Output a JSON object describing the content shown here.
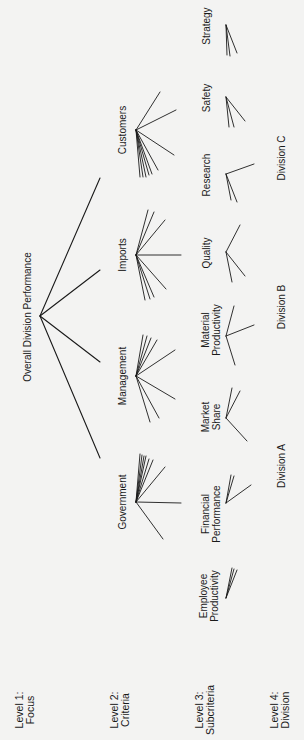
{
  "diagram": {
    "type": "hierarchy",
    "orientation": "rotated-90-ccw",
    "colors": {
      "background": "#f3f3f2",
      "ink": "#1a1a1a"
    },
    "level_labels": [
      {
        "line1": "Level 1:",
        "line2": "Focus",
        "x": 25,
        "y": 710
      },
      {
        "line1": "Level 2:",
        "line2": "Criteria",
        "x": 120,
        "y": 710
      },
      {
        "line1": "Level 3:",
        "line2": "Subcriteria",
        "x": 205,
        "y": 710
      },
      {
        "line1": "Level 4:",
        "line2": "Division",
        "x": 280,
        "y": 710
      }
    ],
    "focus": {
      "label": "Overall Division Performance",
      "label_x": 27,
      "label_y": 317,
      "hub": [
        40,
        316
      ]
    },
    "criteria": [
      {
        "label": "Customers",
        "label_x": 122,
        "label_y": 130,
        "hub": [
          136,
          130
        ],
        "focus_end": [
          100,
          178
        ]
      },
      {
        "label": "Imports",
        "label_x": 122,
        "label_y": 255,
        "hub": [
          136,
          255
        ],
        "focus_end": [
          100,
          270
        ]
      },
      {
        "label": "Management",
        "label_x": 122,
        "label_y": 376,
        "hub": [
          136,
          376
        ],
        "focus_end": [
          100,
          362
        ]
      },
      {
        "label": "Government",
        "label_x": 122,
        "label_y": 502,
        "hub": [
          136,
          502
        ],
        "focus_end": [
          100,
          458
        ]
      }
    ],
    "criteria_fan_ends": {
      "Customers": [
        [
          160,
          92
        ],
        [
          176,
          110
        ],
        [
          174,
          155
        ],
        [
          158,
          170
        ],
        [
          152,
          174
        ],
        [
          149,
          175
        ],
        [
          146,
          177
        ],
        [
          143,
          177
        ],
        [
          140,
          177
        ]
      ],
      "Imports": [
        [
          148,
          210
        ],
        [
          154,
          212
        ],
        [
          165,
          220
        ],
        [
          181,
          255
        ],
        [
          166,
          289
        ],
        [
          154,
          297
        ],
        [
          150,
          299
        ],
        [
          145,
          300
        ]
      ],
      "Management": [
        [
          143,
          335
        ],
        [
          147,
          336
        ],
        [
          151,
          338
        ],
        [
          157,
          340
        ],
        [
          175,
          350
        ],
        [
          175,
          399
        ],
        [
          159,
          418
        ],
        [
          150,
          422
        ]
      ],
      "Government": [
        [
          140,
          454
        ],
        [
          142,
          455
        ],
        [
          144,
          456
        ],
        [
          146,
          456
        ],
        [
          149,
          459
        ],
        [
          153,
          460
        ],
        [
          165,
          467
        ],
        [
          181,
          503
        ],
        [
          163,
          539
        ]
      ]
    },
    "subcriteria": [
      {
        "lines": [
          "Strategy"
        ],
        "label_x": 206,
        "label_y": 26,
        "hub": [
          226,
          25
        ],
        "ends": [
          [
            227,
            55
          ],
          [
            230,
            56
          ],
          [
            237,
            53
          ]
        ]
      },
      {
        "lines": [
          "Safety"
        ],
        "label_x": 206,
        "label_y": 98,
        "hub": [
          226,
          97
        ],
        "ends": [
          [
            229,
            127
          ],
          [
            234,
            127
          ],
          [
            245,
            121
          ]
        ]
      },
      {
        "lines": [
          "Research"
        ],
        "label_x": 206,
        "label_y": 175,
        "hub": [
          226,
          174
        ],
        "ends": [
          [
            254,
            164
          ],
          [
            231,
            200
          ],
          [
            237,
            202
          ]
        ]
      },
      {
        "lines": [
          "Quality"
        ],
        "label_x": 206,
        "label_y": 253,
        "hub": [
          226,
          252
        ],
        "ends": [
          [
            240,
            225
          ],
          [
            232,
            282
          ],
          [
            245,
            276
          ]
        ]
      },
      {
        "lines": [
          "Material",
          "Productivity"
        ],
        "label_x": 211,
        "label_y": 330,
        "hub": [
          226,
          336
        ],
        "ends": [
          [
            234,
            306
          ],
          [
            254,
            325
          ],
          [
            235,
            365
          ]
        ]
      },
      {
        "lines": [
          "Market",
          "Share"
        ],
        "label_x": 211,
        "label_y": 417,
        "hub": [
          226,
          418
        ],
        "ends": [
          [
            232,
            388
          ],
          [
            240,
            391
          ],
          [
            247,
            441
          ]
        ]
      },
      {
        "lines": [
          "Financial",
          "Performance"
        ],
        "label_x": 211,
        "label_y": 514,
        "hub": [
          226,
          503
        ],
        "ends": [
          [
            231,
            475
          ],
          [
            234,
            476
          ],
          [
            251,
            485
          ]
        ]
      },
      {
        "lines": [
          "Employee",
          "Productivity"
        ],
        "label_x": 209,
        "label_y": 596,
        "hub": [
          226,
          598
        ],
        "ends": [
          [
            232,
            568
          ],
          [
            234,
            569
          ],
          [
            237,
            570
          ]
        ]
      }
    ],
    "divisions": [
      {
        "label": "Division A",
        "x": 281,
        "y": 466
      },
      {
        "label": "Division B",
        "x": 281,
        "y": 307
      },
      {
        "label": "Division C",
        "x": 281,
        "y": 158
      }
    ]
  }
}
